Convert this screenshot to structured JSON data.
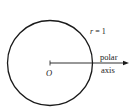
{
  "diagram": {
    "type": "polar-coordinate-unit-circle",
    "radius_label_var": "r",
    "radius_label_eq": " = 1",
    "origin_label": "O",
    "axis_label_line1": "polar",
    "axis_label_line2": "axis",
    "colors": {
      "stroke": "#1a1a1a",
      "text": "#222222",
      "background": "#ffffff"
    }
  }
}
